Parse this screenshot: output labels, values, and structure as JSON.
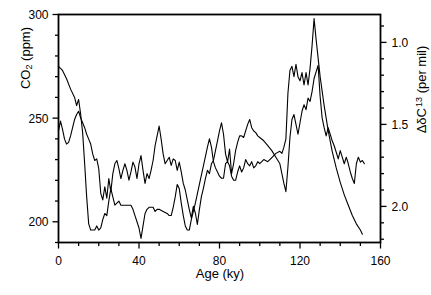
{
  "chart_data": {
    "type": "line",
    "title": "",
    "xlabel": "Age  (ky)",
    "xlim": [
      0,
      160
    ],
    "xticks": [
      0,
      40,
      80,
      120,
      160
    ],
    "xticklabels": [
      "0",
      "40",
      "80",
      "120",
      "160"
    ],
    "xminor_step": 10,
    "grid": false,
    "legend": "none",
    "axes": [
      {
        "id": "left",
        "label": "CO_2 (ppm)",
        "label_text": "CO",
        "label_sub": "2",
        "label_tail": " (ppm)",
        "lim": [
          190,
          300
        ],
        "ticks": [
          200,
          250,
          300
        ],
        "ticklabels": [
          "200",
          "250",
          "300"
        ],
        "minor_step": 10,
        "inverted": false
      },
      {
        "id": "right",
        "label": "DdC 13 (per mil)",
        "label_delta": "ΔδC",
        "label_sup": "13",
        "label_tail": " (per mil)",
        "lim": [
          0.83,
          2.22
        ],
        "ticks": [
          1.0,
          1.5,
          2.0
        ],
        "ticklabels": [
          "1.0",
          "1.5",
          "2.0"
        ],
        "minor_step": 0.1,
        "inverted": true
      }
    ],
    "series": [
      {
        "name": "CO2",
        "axis": "left",
        "color": "#000000",
        "linewidth": 1.1,
        "units": "ppm",
        "points": [
          [
            0,
            275
          ],
          [
            2,
            273
          ],
          [
            4,
            269
          ],
          [
            6,
            264
          ],
          [
            8,
            260
          ],
          [
            9,
            256
          ],
          [
            10,
            259
          ],
          [
            11,
            252
          ],
          [
            12,
            243
          ],
          [
            13,
            228
          ],
          [
            14,
            212
          ],
          [
            15,
            199
          ],
          [
            16,
            196
          ],
          [
            18,
            196
          ],
          [
            19,
            198
          ],
          [
            20,
            196
          ],
          [
            21,
            197
          ],
          [
            22,
            201
          ],
          [
            23,
            204
          ],
          [
            24,
            203
          ],
          [
            25,
            210
          ],
          [
            26,
            216
          ],
          [
            27,
            212
          ],
          [
            28,
            208
          ],
          [
            29,
            209
          ],
          [
            30,
            210
          ],
          [
            31,
            208
          ],
          [
            32,
            208
          ],
          [
            34,
            208
          ],
          [
            36,
            208
          ],
          [
            37,
            206
          ],
          [
            38,
            203
          ],
          [
            39,
            200
          ],
          [
            40,
            197
          ],
          [
            41,
            192
          ],
          [
            42,
            198
          ],
          [
            43,
            204
          ],
          [
            44,
            206
          ],
          [
            45,
            207
          ],
          [
            47,
            207
          ],
          [
            48,
            205
          ],
          [
            49,
            206
          ],
          [
            50,
            206
          ],
          [
            52,
            205
          ],
          [
            54,
            204
          ],
          [
            55,
            203
          ],
          [
            56,
            203
          ],
          [
            57,
            207
          ],
          [
            58,
            212
          ],
          [
            59,
            218
          ],
          [
            60,
            216
          ],
          [
            61,
            209
          ],
          [
            62,
            203
          ],
          [
            63,
            198
          ],
          [
            64,
            196
          ],
          [
            65,
            196
          ],
          [
            66,
            201
          ],
          [
            68,
            209
          ],
          [
            70,
            218
          ],
          [
            72,
            227
          ],
          [
            74,
            236
          ],
          [
            75,
            240
          ],
          [
            76,
            236
          ],
          [
            77,
            229
          ],
          [
            78,
            226
          ],
          [
            79,
            224
          ],
          [
            80,
            222
          ],
          [
            81,
            221
          ],
          [
            82,
            221
          ],
          [
            83,
            228
          ],
          [
            84,
            229
          ],
          [
            85,
            227
          ],
          [
            86,
            222
          ],
          [
            87,
            220
          ],
          [
            88,
            220
          ],
          [
            89,
            224
          ],
          [
            90,
            227
          ],
          [
            91,
            224
          ],
          [
            92,
            226
          ],
          [
            93,
            230
          ],
          [
            94,
            228
          ],
          [
            95,
            227
          ],
          [
            96,
            229
          ],
          [
            97,
            226
          ],
          [
            98,
            227
          ],
          [
            99,
            229
          ],
          [
            100,
            228
          ],
          [
            102,
            230
          ],
          [
            104,
            229
          ],
          [
            106,
            231
          ],
          [
            108,
            233
          ],
          [
            110,
            234
          ],
          [
            111,
            233
          ],
          [
            112,
            236
          ],
          [
            113,
            240
          ],
          [
            114,
            262
          ],
          [
            115,
            273
          ],
          [
            116,
            275
          ],
          [
            117,
            270
          ],
          [
            118,
            276
          ],
          [
            119,
            270
          ],
          [
            120,
            268
          ],
          [
            121,
            272
          ],
          [
            122,
            266
          ],
          [
            123,
            272
          ],
          [
            124,
            266
          ],
          [
            125,
            274
          ],
          [
            126,
            285
          ],
          [
            127,
            298
          ],
          [
            128,
            288
          ],
          [
            130,
            270
          ],
          [
            132,
            256
          ],
          [
            134,
            244
          ],
          [
            136,
            234
          ],
          [
            138,
            226
          ],
          [
            140,
            219
          ],
          [
            142,
            213
          ],
          [
            144,
            208
          ],
          [
            146,
            203
          ],
          [
            148,
            199
          ],
          [
            150,
            196
          ],
          [
            151,
            194
          ]
        ]
      },
      {
        "name": "Delta d13C",
        "axis": "right",
        "color": "#000000",
        "linewidth": 1.1,
        "units": "per mil",
        "points": [
          [
            0,
            1.54
          ],
          [
            1,
            1.48
          ],
          [
            2,
            1.53
          ],
          [
            3,
            1.59
          ],
          [
            4,
            1.62
          ],
          [
            5,
            1.61
          ],
          [
            6,
            1.57
          ],
          [
            7,
            1.52
          ],
          [
            8,
            1.47
          ],
          [
            9,
            1.44
          ],
          [
            10,
            1.42
          ],
          [
            11,
            1.46
          ],
          [
            12,
            1.49
          ],
          [
            13,
            1.52
          ],
          [
            14,
            1.56
          ],
          [
            15,
            1.59
          ],
          [
            16,
            1.62
          ],
          [
            17,
            1.68
          ],
          [
            18,
            1.72
          ],
          [
            19,
            1.71
          ],
          [
            20,
            1.77
          ],
          [
            21,
            1.92
          ],
          [
            22,
            1.96
          ],
          [
            23,
            1.88
          ],
          [
            24,
            1.95
          ],
          [
            25,
            1.83
          ],
          [
            26,
            1.91
          ],
          [
            27,
            1.8
          ],
          [
            28,
            1.74
          ],
          [
            29,
            1.72
          ],
          [
            30,
            1.77
          ],
          [
            31,
            1.83
          ],
          [
            32,
            1.78
          ],
          [
            33,
            1.74
          ],
          [
            34,
            1.78
          ],
          [
            35,
            1.84
          ],
          [
            36,
            1.79
          ],
          [
            37,
            1.73
          ],
          [
            38,
            1.76
          ],
          [
            39,
            1.83
          ],
          [
            40,
            1.74
          ],
          [
            41,
            1.69
          ],
          [
            42,
            1.78
          ],
          [
            43,
            1.86
          ],
          [
            44,
            1.8
          ],
          [
            45,
            1.83
          ],
          [
            46,
            1.78
          ],
          [
            47,
            1.72
          ],
          [
            48,
            1.63
          ],
          [
            49,
            1.57
          ],
          [
            50,
            1.51
          ],
          [
            51,
            1.59
          ],
          [
            52,
            1.68
          ],
          [
            53,
            1.74
          ],
          [
            54,
            1.72
          ],
          [
            55,
            1.7
          ],
          [
            56,
            1.75
          ],
          [
            57,
            1.71
          ],
          [
            58,
            1.72
          ],
          [
            59,
            1.78
          ],
          [
            60,
            1.73
          ],
          [
            61,
            1.79
          ],
          [
            62,
            1.86
          ],
          [
            63,
            1.9
          ],
          [
            64,
            1.96
          ],
          [
            65,
            2.02
          ],
          [
            66,
            2.07
          ],
          [
            67,
            2.0
          ],
          [
            68,
            2.04
          ],
          [
            69,
            2.11
          ],
          [
            70,
            2.02
          ],
          [
            71,
            1.94
          ],
          [
            72,
            1.89
          ],
          [
            73,
            1.83
          ],
          [
            74,
            1.78
          ],
          [
            75,
            1.8
          ],
          [
            76,
            1.74
          ],
          [
            77,
            1.72
          ],
          [
            78,
            1.66
          ],
          [
            79,
            1.6
          ],
          [
            80,
            1.54
          ],
          [
            81,
            1.49
          ],
          [
            82,
            1.56
          ],
          [
            83,
            1.68
          ],
          [
            84,
            1.73
          ],
          [
            85,
            1.65
          ],
          [
            86,
            1.8
          ],
          [
            87,
            1.74
          ],
          [
            88,
            1.66
          ],
          [
            89,
            1.61
          ],
          [
            90,
            1.57
          ],
          [
            91,
            1.57
          ],
          [
            92,
            1.58
          ],
          [
            93,
            1.54
          ],
          [
            94,
            1.5
          ],
          [
            95,
            1.47
          ],
          [
            96,
            1.52
          ],
          [
            97,
            1.54
          ],
          [
            98,
            1.55
          ],
          [
            99,
            1.57
          ],
          [
            100,
            1.58
          ],
          [
            102,
            1.6
          ],
          [
            104,
            1.63
          ],
          [
            106,
            1.66
          ],
          [
            108,
            1.7
          ],
          [
            110,
            1.74
          ],
          [
            111,
            1.8
          ],
          [
            112,
            1.86
          ],
          [
            113,
            1.91
          ],
          [
            114,
            1.76
          ],
          [
            115,
            1.58
          ],
          [
            116,
            1.47
          ],
          [
            117,
            1.44
          ],
          [
            118,
            1.5
          ],
          [
            119,
            1.56
          ],
          [
            120,
            1.49
          ],
          [
            121,
            1.42
          ],
          [
            122,
            1.38
          ],
          [
            123,
            1.41
          ],
          [
            124,
            1.34
          ],
          [
            125,
            1.36
          ],
          [
            126,
            1.3
          ],
          [
            127,
            1.22
          ],
          [
            128,
            1.18
          ],
          [
            129,
            1.14
          ],
          [
            130,
            1.33
          ],
          [
            131,
            1.46
          ],
          [
            132,
            1.52
          ],
          [
            133,
            1.57
          ],
          [
            134,
            1.52
          ],
          [
            135,
            1.56
          ],
          [
            136,
            1.6
          ],
          [
            137,
            1.63
          ],
          [
            138,
            1.67
          ],
          [
            139,
            1.71
          ],
          [
            140,
            1.66
          ],
          [
            141,
            1.7
          ],
          [
            142,
            1.74
          ],
          [
            143,
            1.7
          ],
          [
            144,
            1.74
          ],
          [
            145,
            1.79
          ],
          [
            146,
            1.83
          ],
          [
            147,
            1.86
          ],
          [
            148,
            1.74
          ],
          [
            149,
            1.7
          ],
          [
            150,
            1.73
          ],
          [
            151,
            1.72
          ],
          [
            152,
            1.74
          ]
        ]
      }
    ]
  },
  "figure": {
    "xlabel": "Age  (ky)",
    "left_axis_label_main": "CO",
    "left_axis_label_sub": "2",
    "left_axis_label_tail": " (ppm)",
    "right_axis_label_main": "ΔδC",
    "right_axis_label_sup": "13",
    "right_axis_label_tail": " (per mil)"
  }
}
